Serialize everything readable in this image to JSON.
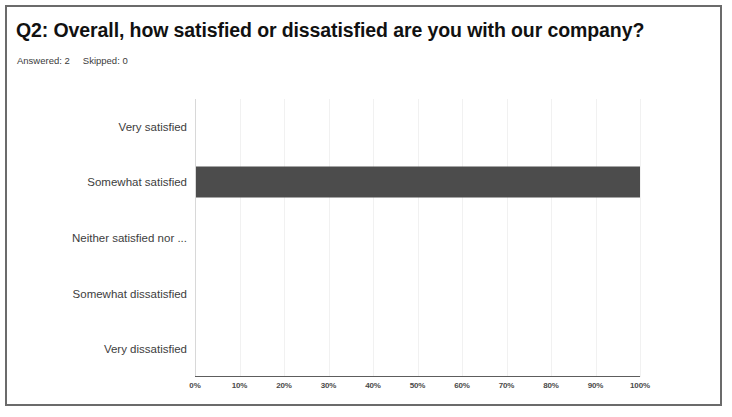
{
  "card": {
    "border_color": "#6b6b6b",
    "background": "#ffffff"
  },
  "header": {
    "title": "Q2:  Overall, how satisfied or dissatisfied are you with our company?",
    "answered_label": "Answered: 2",
    "skipped_label": "Skipped: 0"
  },
  "chart_data": {
    "type": "bar",
    "orientation": "horizontal",
    "title": "Q2:  Overall, how satisfied or dissatisfied are you with our company?",
    "xlabel": "",
    "ylabel": "",
    "categories": [
      "Very satisfied",
      "Somewhat satisfied",
      "Neither satisfied nor ...",
      "Somewhat dissatisfied",
      "Very dissatisfied"
    ],
    "values": [
      0,
      100,
      0,
      0,
      0
    ],
    "value_unit": "%",
    "xlim": [
      0,
      100
    ],
    "xticks": [
      0,
      10,
      20,
      30,
      40,
      50,
      60,
      70,
      80,
      90,
      100
    ],
    "xticklabels": [
      "0%",
      "10%",
      "20%",
      "30%",
      "40%",
      "50%",
      "60%",
      "70%",
      "80%",
      "90%",
      "100%"
    ],
    "grid": true,
    "legend": false,
    "bar_color": "#4c4c4c",
    "responses": {
      "answered": 2,
      "skipped": 0
    }
  }
}
